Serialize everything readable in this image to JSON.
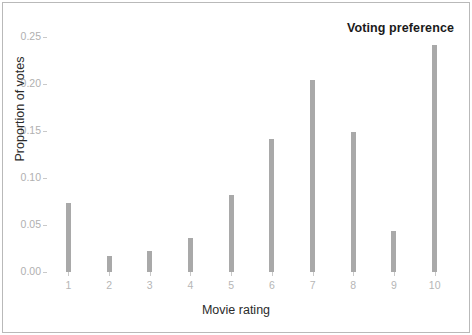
{
  "chart_data": {
    "type": "bar",
    "title": "Voting preference",
    "xlabel": "Movie rating",
    "ylabel": "Proportion of votes",
    "categories": [
      "1",
      "2",
      "3",
      "4",
      "5",
      "6",
      "7",
      "8",
      "9",
      "10"
    ],
    "values": [
      0.074,
      0.017,
      0.022,
      0.036,
      0.082,
      0.142,
      0.205,
      0.149,
      0.044,
      0.242
    ],
    "ylim": [
      0.0,
      0.26
    ],
    "yticks": [
      0.0,
      0.05,
      0.1,
      0.15,
      0.2,
      0.25
    ],
    "ytick_labels": [
      "0.00",
      "0.05",
      "0.10",
      "0.15",
      "0.20",
      "0.25"
    ],
    "grid": false,
    "legend": "none",
    "bar_color": "#a9a9a9",
    "title_position": "top-right",
    "axis_text_color": "#b0b0b0",
    "background_color": "#ffffff",
    "border_color": "#b9b9b9"
  }
}
